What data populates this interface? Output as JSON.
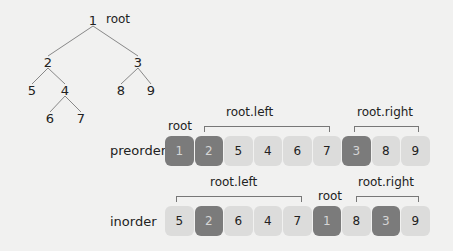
{
  "tree": {
    "root_label": "root",
    "nodes": [
      {
        "id": "1",
        "x": 93,
        "y": 20
      },
      {
        "id": "2",
        "x": 48,
        "y": 62
      },
      {
        "id": "3",
        "x": 138,
        "y": 62
      },
      {
        "id": "5",
        "x": 32,
        "y": 90
      },
      {
        "id": "4",
        "x": 65,
        "y": 90
      },
      {
        "id": "8",
        "x": 121,
        "y": 90
      },
      {
        "id": "9",
        "x": 151,
        "y": 90
      },
      {
        "id": "6",
        "x": 50,
        "y": 118
      },
      {
        "id": "7",
        "x": 81,
        "y": 118
      }
    ],
    "edges": [
      [
        "1",
        "2"
      ],
      [
        "1",
        "3"
      ],
      [
        "2",
        "5"
      ],
      [
        "2",
        "4"
      ],
      [
        "4",
        "6"
      ],
      [
        "4",
        "7"
      ],
      [
        "3",
        "8"
      ],
      [
        "3",
        "9"
      ]
    ]
  },
  "preorder": {
    "label": "preorder",
    "root_label": "root",
    "left_label": "root.left",
    "right_label": "root.right",
    "cells": [
      {
        "v": "1",
        "dark": true
      },
      {
        "v": "2",
        "dark": true
      },
      {
        "v": "5",
        "dark": false
      },
      {
        "v": "4",
        "dark": false
      },
      {
        "v": "6",
        "dark": false
      },
      {
        "v": "7",
        "dark": false
      },
      {
        "v": "3",
        "dark": true
      },
      {
        "v": "8",
        "dark": false
      },
      {
        "v": "9",
        "dark": false
      }
    ]
  },
  "inorder": {
    "label": "inorder",
    "root_label": "root",
    "left_label": "root.left",
    "right_label": "root.right",
    "cells": [
      {
        "v": "5",
        "dark": false
      },
      {
        "v": "2",
        "dark": true
      },
      {
        "v": "6",
        "dark": false
      },
      {
        "v": "4",
        "dark": false
      },
      {
        "v": "7",
        "dark": false
      },
      {
        "v": "1",
        "dark": true
      },
      {
        "v": "8",
        "dark": false
      },
      {
        "v": "3",
        "dark": true
      },
      {
        "v": "9",
        "dark": false
      }
    ]
  },
  "colors": {
    "background": "#f1f1f0",
    "dark_cell": "#7b7b7b",
    "light_cell": "#dcdcdb",
    "line": "#777777"
  }
}
